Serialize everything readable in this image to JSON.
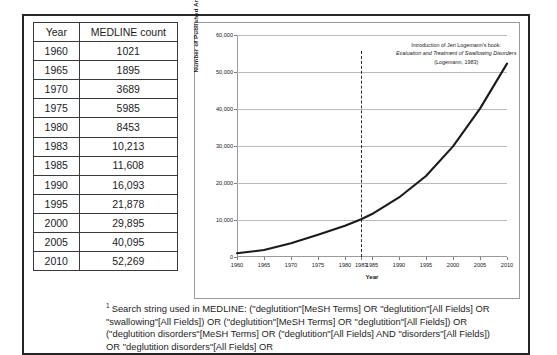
{
  "table": {
    "headers": [
      "Year",
      "MEDLINE count"
    ],
    "rows": [
      [
        "1960",
        "1021"
      ],
      [
        "1965",
        "1895"
      ],
      [
        "1970",
        "3689"
      ],
      [
        "1975",
        "5985"
      ],
      [
        "1980",
        "8453"
      ],
      [
        "1983",
        "10,213"
      ],
      [
        "1985",
        "11,608"
      ],
      [
        "1990",
        "16,093"
      ],
      [
        "1995",
        "21,878"
      ],
      [
        "2000",
        "29,895"
      ],
      [
        "2005",
        "40,095"
      ],
      [
        "2010",
        "52,269"
      ]
    ]
  },
  "annotation": {
    "line1": "Introduction of Jeri Logemann's book:",
    "line2": "Evaluation and Treatment of Swallowing Disorders",
    "line3": "(Logemann, 1983)"
  },
  "footnote": {
    "marker": "1",
    "text": "Search string used in MEDLINE: (\"deglutition\"[MeSH Terms] OR \"deglutition\"[All Fields] OR \"swallowing\"[All Fields]) OR (\"deglutition\"[MeSH Terms] OR \"deglutition\"[All Fields]) OR (\"deglutition disorders\"[MeSH Terms] OR (\"deglutition\"[All Fields] AND \"disorders\"[All Fields]) OR \"deglutition disorders\"[All Fields] OR"
  },
  "chart_data": {
    "type": "line",
    "title": "",
    "xlabel": "Year",
    "ylabel": "Number of Published Articles",
    "x": [
      1960,
      1965,
      1970,
      1975,
      1980,
      1983,
      1985,
      1990,
      1995,
      2000,
      2005,
      2010
    ],
    "values": [
      1021,
      1895,
      3689,
      5985,
      8453,
      10213,
      11608,
      16093,
      21878,
      29895,
      40095,
      52269
    ],
    "xtick_labels": [
      "1960",
      "1965",
      "1970",
      "1975",
      "1980",
      "1983",
      "1985",
      "1990",
      "1995",
      "2000",
      "2005",
      "2010"
    ],
    "ytick_labels": [
      "0",
      "10,000",
      "20,000",
      "30,000",
      "40,000",
      "50,000",
      "60,000"
    ],
    "ytick_values": [
      0,
      10000,
      20000,
      30000,
      40000,
      50000,
      60000
    ],
    "ylim": [
      0,
      60000
    ],
    "xlim": [
      1960,
      2010
    ],
    "grid": true,
    "legend": "none",
    "series_color": "#1a1a1a",
    "annotation_year": 1983,
    "annotation_line_style": "dashed"
  }
}
